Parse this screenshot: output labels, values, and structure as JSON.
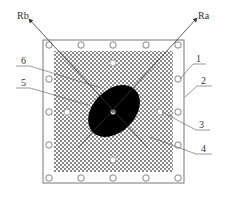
{
  "diagram": {
    "labels": {
      "rb": "Rb",
      "ra": "Ra",
      "l1": "1",
      "l2": "2",
      "l3": "3",
      "l4": "4",
      "l5": "5",
      "l6": "6"
    },
    "colors": {
      "line": "#555555",
      "hatch": "#888888",
      "fill": "#000000",
      "background": "#ffffff"
    },
    "outer_frame_holes": 16,
    "inner_holes": 4
  }
}
